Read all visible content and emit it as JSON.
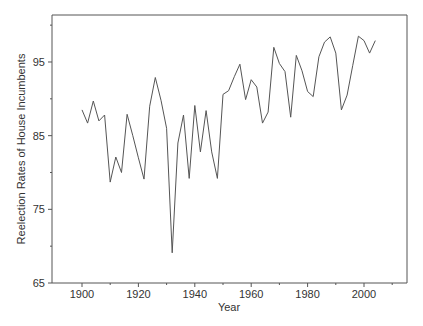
{
  "chart_data": {
    "type": "line",
    "title": "",
    "xlabel": "Year",
    "ylabel": "Reelection Rates of House Incumbents",
    "xlim": [
      1890,
      2015
    ],
    "ylim": [
      65,
      100
    ],
    "x_ticks": [
      1900,
      1920,
      1940,
      1960,
      1980,
      2000
    ],
    "x_tick_labels": [
      "1900",
      "1920",
      "1940",
      "1960",
      "1980",
      "2000"
    ],
    "x_minor_ticks": [
      1910,
      1930,
      1950,
      1970,
      1990,
      2010
    ],
    "y_ticks": [
      65,
      75,
      85,
      95
    ],
    "y_tick_labels": [
      "65",
      "75",
      "85",
      "95"
    ],
    "y_minor_ticks": [
      70,
      80,
      90,
      100
    ],
    "grid": false,
    "legend": null,
    "series": [
      {
        "name": "Reelection Rate",
        "x": [
          1900,
          1902,
          1904,
          1906,
          1908,
          1910,
          1912,
          1914,
          1916,
          1918,
          1920,
          1922,
          1924,
          1926,
          1928,
          1930,
          1932,
          1934,
          1936,
          1938,
          1940,
          1942,
          1944,
          1946,
          1948,
          1950,
          1952,
          1954,
          1956,
          1958,
          1960,
          1962,
          1964,
          1966,
          1968,
          1970,
          1972,
          1974,
          1976,
          1978,
          1980,
          1982,
          1984,
          1986,
          1988,
          1990,
          1992,
          1994,
          1996,
          1998,
          2000,
          2002,
          2004
        ],
        "values": [
          88.5,
          86.7,
          89.7,
          87.0,
          87.8,
          78.7,
          82.1,
          80.0,
          87.9,
          85.0,
          82.0,
          79.1,
          89.0,
          92.9,
          89.8,
          86.0,
          69.1,
          84.0,
          87.8,
          79.2,
          89.1,
          82.8,
          88.4,
          82.8,
          79.2,
          90.6,
          91.1,
          93.0,
          94.7,
          89.9,
          92.6,
          91.6,
          86.7,
          88.2,
          97.0,
          94.8,
          93.7,
          87.5,
          95.9,
          93.8,
          91.0,
          90.3,
          95.7,
          97.7,
          98.4,
          96.2,
          88.5,
          90.5,
          94.5,
          98.5,
          97.9,
          96.2,
          97.9
        ]
      }
    ]
  },
  "axes": {
    "x_label": "Year",
    "y_label": "Reelection Rates of House Incumbents"
  }
}
